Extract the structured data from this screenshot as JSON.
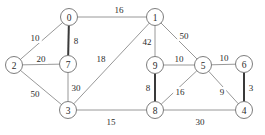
{
  "diagram": {
    "type": "node-link-graph",
    "canvas": {
      "width": 265,
      "height": 135,
      "background": "#ffffff"
    },
    "style": {
      "edge_color": "#8c8c8c",
      "edge_color_bold": "#3a3a3a",
      "node_fill": "#ffffff",
      "node_stroke": "#6e6e6e",
      "text_color": "#2b2b2b",
      "node_radius": 8.5
    },
    "nodes": [
      {
        "id": "0",
        "label": "0",
        "x": 69,
        "y": 17
      },
      {
        "id": "1",
        "label": "1",
        "x": 155,
        "y": 17
      },
      {
        "id": "2",
        "label": "2",
        "x": 14,
        "y": 65
      },
      {
        "id": "7",
        "label": "7",
        "x": 68,
        "y": 64
      },
      {
        "id": "9",
        "label": "9",
        "x": 155,
        "y": 65
      },
      {
        "id": "5",
        "label": "5",
        "x": 203,
        "y": 65
      },
      {
        "id": "6",
        "label": "6",
        "x": 244,
        "y": 64
      },
      {
        "id": "3",
        "label": "3",
        "x": 68,
        "y": 110
      },
      {
        "id": "8",
        "label": "8",
        "x": 155,
        "y": 110
      },
      {
        "id": "4",
        "label": "4",
        "x": 244,
        "y": 110
      }
    ],
    "edges": [
      {
        "source": "0",
        "target": "1",
        "weight": "16",
        "bold": false,
        "lx": 119,
        "ly": 10
      },
      {
        "source": "0",
        "target": "2",
        "weight": "10",
        "bold": false,
        "lx": 35,
        "ly": 38
      },
      {
        "source": "0",
        "target": "7",
        "weight": "8",
        "bold": true,
        "lx": 76,
        "ly": 41
      },
      {
        "source": "2",
        "target": "7",
        "weight": "20",
        "bold": false,
        "lx": 41,
        "ly": 59
      },
      {
        "source": "2",
        "target": "3",
        "weight": "50",
        "bold": false,
        "lx": 35,
        "ly": 94
      },
      {
        "source": "7",
        "target": "3",
        "weight": "30",
        "bold": false,
        "lx": 76,
        "ly": 88
      },
      {
        "source": "3",
        "target": "1",
        "weight": "18",
        "bold": false,
        "lx": 101,
        "ly": 59
      },
      {
        "source": "1",
        "target": "9",
        "weight": "42",
        "bold": false,
        "lx": 147,
        "ly": 42
      },
      {
        "source": "1",
        "target": "5",
        "weight": "50",
        "bold": false,
        "lx": 184,
        "ly": 36
      },
      {
        "source": "9",
        "target": "5",
        "weight": "10",
        "bold": false,
        "lx": 179,
        "ly": 59
      },
      {
        "source": "5",
        "target": "6",
        "weight": "10",
        "bold": false,
        "lx": 224,
        "ly": 58
      },
      {
        "source": "9",
        "target": "8",
        "weight": "8",
        "bold": true,
        "lx": 148,
        "ly": 88
      },
      {
        "source": "8",
        "target": "5",
        "weight": "16",
        "bold": false,
        "lx": 180,
        "ly": 92
      },
      {
        "source": "5",
        "target": "4",
        "weight": "9",
        "bold": false,
        "lx": 222,
        "ly": 92
      },
      {
        "source": "6",
        "target": "4",
        "weight": "3",
        "bold": true,
        "lx": 251,
        "ly": 88
      },
      {
        "source": "3",
        "target": "8",
        "weight": "15",
        "bold": false,
        "lx": 111,
        "ly": 122
      },
      {
        "source": "8",
        "target": "4",
        "weight": "30",
        "bold": false,
        "lx": 200,
        "ly": 122
      }
    ]
  }
}
